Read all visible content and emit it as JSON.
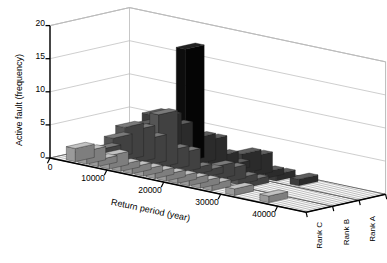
{
  "chart_data": {
    "type": "bar",
    "subtype": "3d-grouped-histogram",
    "title": "",
    "xlabel": "Return period (year)",
    "ylabel": "Active fault (frequency)",
    "zlabel": "",
    "xlim": [
      0,
      45000
    ],
    "ylim": [
      0,
      20
    ],
    "grid": true,
    "legend_position": "none",
    "xticks": [
      0,
      10000,
      20000,
      30000,
      40000
    ],
    "xticklabels": [
      "0",
      "10000",
      "20000",
      "30000",
      "40000"
    ],
    "yticks": [
      0,
      5,
      10,
      15,
      20
    ],
    "yticklabels": [
      "0",
      "5",
      "10",
      "15",
      "20"
    ],
    "zticklabels": [
      "Rank C",
      "Rank B",
      "Rank A"
    ],
    "bin_width": 2000,
    "bin_centers": [
      1000,
      3000,
      5000,
      7000,
      9000,
      11000,
      13000,
      15000,
      17000,
      19000,
      21000,
      23000,
      25000,
      27000,
      29000,
      31000,
      33000,
      35000,
      37000,
      39000,
      41000,
      43000
    ],
    "series": [
      {
        "name": "Rank A",
        "color": "#3c3c3c",
        "values": [
          0,
          1,
          4,
          6,
          6,
          5,
          17,
          4,
          4,
          2,
          1,
          3,
          3,
          1,
          1,
          0,
          1,
          0,
          0,
          0,
          0,
          0
        ]
      },
      {
        "name": "Rank B",
        "color": "#555555",
        "values": [
          0,
          1,
          3,
          5,
          5,
          4,
          8,
          3,
          3,
          1,
          1,
          2,
          2,
          1,
          1,
          0,
          0,
          0,
          0,
          0,
          0,
          0
        ]
      },
      {
        "name": "Rank C",
        "color": "#9a9a9a",
        "values": [
          0,
          2,
          2,
          1,
          2,
          1,
          1,
          1,
          1,
          1,
          1,
          1,
          1,
          1,
          0,
          1,
          0,
          0,
          1,
          0,
          0,
          0
        ]
      }
    ]
  },
  "axis": {
    "y_title": "Active fault (frequency)",
    "x_title": "Return period (year)",
    "x_tick_0": "0",
    "x_tick_1": "10000",
    "x_tick_2": "20000",
    "x_tick_3": "30000",
    "x_tick_4": "40000",
    "y_tick_0": "0",
    "y_tick_5": "5",
    "y_tick_10": "10",
    "y_tick_15": "15",
    "y_tick_20": "20",
    "origin_label": "0"
  },
  "depth_axis": {
    "rank_c": "Rank C",
    "rank_b": "Rank B",
    "rank_a": "Rank A"
  },
  "colors": {
    "frame": "#000000",
    "grid": "#b9b9b9",
    "floor": "#ffffff",
    "bar_front": "#9a9a9a",
    "bar_mid": "#555555",
    "bar_back": "#3c3c3c",
    "bar_peak": "#0d0d0d"
  }
}
